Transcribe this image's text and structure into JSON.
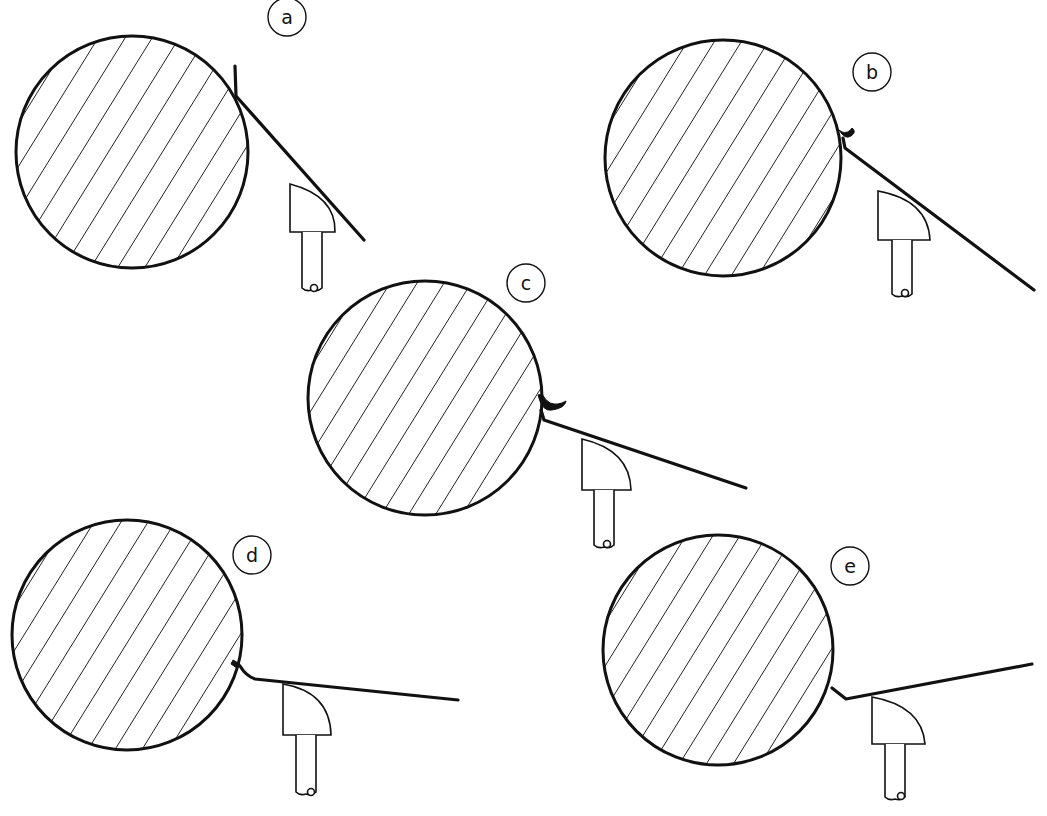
{
  "figure": {
    "ink_color": "#111111",
    "background_color": "#ffffff",
    "panels": [
      {
        "id": "a",
        "label": "a",
        "chip": "none",
        "blade_contact": "tangent"
      },
      {
        "id": "b",
        "label": "b",
        "chip": "small",
        "blade_contact": "edge"
      },
      {
        "id": "c",
        "label": "c",
        "chip": "large",
        "blade_contact": "edge"
      },
      {
        "id": "d",
        "label": "d",
        "chip": "tiny",
        "blade_contact": "bent"
      },
      {
        "id": "e",
        "label": "e",
        "chip": "none",
        "blade_contact": "bent"
      }
    ]
  }
}
